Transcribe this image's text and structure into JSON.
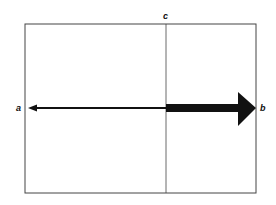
{
  "diagram": {
    "type": "force-vector-diagram",
    "labels": {
      "a": "a",
      "b": "b",
      "c": "c"
    },
    "box": {
      "x": 25,
      "y": 24,
      "width": 231,
      "height": 169
    },
    "divider": {
      "x": 166,
      "label": "c"
    },
    "arrows": [
      {
        "name": "thin-arrow-to-a",
        "from_x": 166,
        "to_x": 28,
        "y": 108,
        "thickness": "thin",
        "direction": "left",
        "label": "a"
      },
      {
        "name": "thick-arrow-to-b",
        "from_x": 166,
        "to_x": 256,
        "y": 108,
        "thickness": "thick",
        "direction": "right",
        "label": "b"
      }
    ],
    "colors": {
      "stroke": "#333333",
      "fill": "#111111",
      "background": "#ffffff"
    }
  }
}
